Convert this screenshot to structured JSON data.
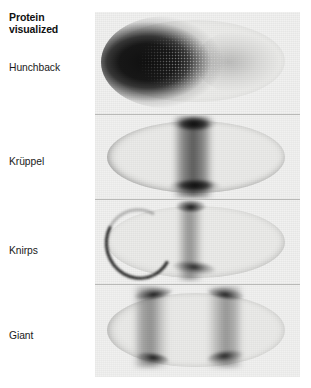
{
  "figure": {
    "title": "Protein\nvisualized",
    "background_color": "#ffffff",
    "panel_background_color": "#f1f1f0",
    "stain_color": "#0a0a0a",
    "rows": [
      {
        "label": "Hunchback",
        "panel_name": "hunchback-embryo-panel",
        "description": "Drosophila embryo stained for Hunchback protein; dense dark staining fills the anterior half and fades sharply near the middle of the egg.",
        "expression_domain": "anterior 0-45% egg length",
        "intensity": "very high"
      },
      {
        "label": "Krüppel",
        "panel_name": "kruppel-embryo-panel",
        "description": "Embryo stained for Krüppel protein; a single broad central band crosses the embryo, darkest at the dorsal and ventral edges.",
        "expression_domain": "central band ~45-55% egg length",
        "intensity": "high"
      },
      {
        "label": "Knirps",
        "panel_name": "knirps-embryo-panel",
        "description": "Embryo stained for Knirps protein; a thin anterior crescent near the anterior pole plus a band just posterior to the middle of the embryo.",
        "expression_domain": "anterior cap stripe and posterior band ~50-60% egg length",
        "intensity": "moderate"
      },
      {
        "label": "Giant",
        "panel_name": "giant-embryo-panel",
        "description": "Embryo stained for Giant protein; two broad stripes, one anterior and one posterior, each darkest at the dorsal and ventral margins.",
        "expression_domain": "two stripes at ~30% and ~68% egg length",
        "intensity": "moderate"
      }
    ]
  }
}
